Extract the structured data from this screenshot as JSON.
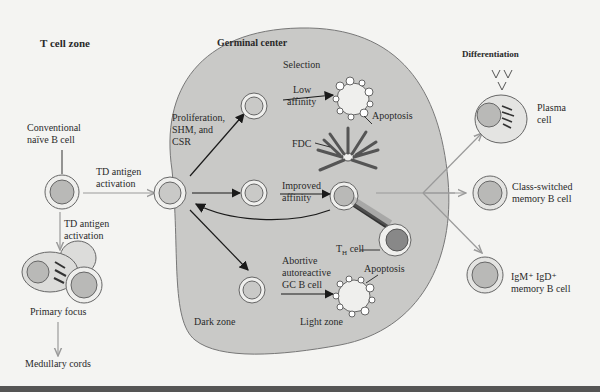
{
  "diagram": {
    "regions": {
      "t_cell_zone": "T cell zone",
      "germinal_center": "Germinal center",
      "differentiation": "Differentiation",
      "dark_zone": "Dark zone",
      "light_zone": "Light zone",
      "selection": "Selection"
    },
    "labels": {
      "naive_b_cell_1": "Conventional",
      "naive_b_cell_2": "naïve B cell",
      "td_antigen_1": "TD antigen",
      "td_antigen_2": "activation",
      "td_antigen_down_1": "TD antigen",
      "td_antigen_down_2": "activation",
      "primary_focus": "Primary focus",
      "medullary_cords": "Medullary cords",
      "proliferation_1": "Proliferation,",
      "proliferation_2": "SHM, and",
      "proliferation_3": "CSR",
      "low_affinity_1": "Low",
      "low_affinity_2": "affinity",
      "apoptosis_top": "Apoptosis",
      "fdc": "FDC",
      "improved_affinity_1": "Improved",
      "improved_affinity_2": "affinity",
      "th_cell": "T",
      "th_cell_sub": "H",
      "th_cell_suffix": " cell",
      "abortive_1": "Abortive",
      "abortive_2": "autoreactive",
      "abortive_3": "GC B cell",
      "apoptosis_bottom": "Apoptosis",
      "plasma_cell_1": "Plasma",
      "plasma_cell_2": "cell",
      "class_switched_1": "Class-switched",
      "class_switched_2": "memory B cell",
      "igm_igd_1": "IgM⁺ IgD⁺",
      "igm_igd_2": "memory B cell"
    },
    "colors": {
      "background": "#f4f4f2",
      "germinal_center": "#c9c9c7",
      "cell_nucleus": "#b9b9b7",
      "arrow_black": "#1a1a1a",
      "arrow_gray": "#9a9a9a"
    }
  }
}
